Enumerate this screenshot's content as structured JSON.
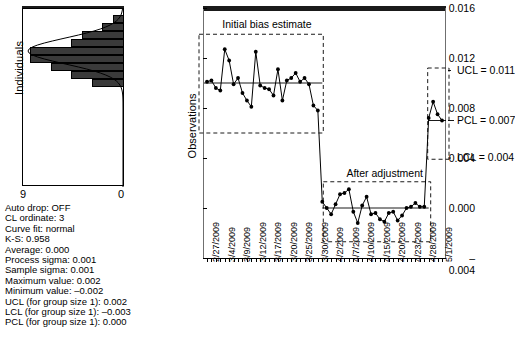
{
  "histogram": {
    "y_axis_label": "Individuals",
    "tick_left": "9",
    "tick_right": "0",
    "bins": [
      {
        "count": 1,
        "y": 96
      },
      {
        "count": 2,
        "y": 104
      },
      {
        "count": 4,
        "y": 112
      },
      {
        "count": 5,
        "y": 120
      },
      {
        "count": 9,
        "y": 128
      },
      {
        "count": 9,
        "y": 136
      },
      {
        "count": 7,
        "y": 144
      },
      {
        "count": 5,
        "y": 152
      },
      {
        "count": 3,
        "y": 160
      }
    ],
    "max_count": 9,
    "curve_fit": "normal"
  },
  "stats": {
    "auto_drop": "Auto drop: OFF",
    "cl_ordinate": "CL ordinate: 3",
    "curve_fit": "Curve fit: normal",
    "ks": "K-S: 0.958",
    "average": "Average: 0.000",
    "process_sigma": "Process sigma: 0.001",
    "sample_sigma": "Sample sigma: 0.001",
    "maximum_value": "Maximum value: 0.002",
    "minimum_value": "Minimum value: –0.002",
    "ucl": "UCL (for group size 1): 0.002",
    "lcl": "LCL (for group size 1): –0.003",
    "pcl": "PCL (for group size 1): 0.000"
  },
  "chart_data": {
    "type": "line",
    "title": "",
    "xlabel": "",
    "ylabel": "Observations",
    "ylim": [
      -0.004,
      0.016
    ],
    "yticks": [
      0.016,
      0.012,
      0.008,
      0.004,
      0.0,
      -0.004
    ],
    "ytick_labels": [
      "0.016",
      "0.012",
      "0.008",
      "0.004",
      "0.000",
      "–0.004"
    ],
    "grid": false,
    "legend": "none",
    "xtick_labels": [
      "2/27/2009",
      "3/4/2009",
      "3/9/2009",
      "3/12/2009",
      "3/17/2009",
      "3/20/2009",
      "3/25/2009",
      "3/30/2009",
      "4/2/2009",
      "4/7/2009",
      "4/10/2009",
      "4/15/2009",
      "4/20/2009",
      "4/23/2009",
      "4/28/2009",
      "5/1/2009"
    ],
    "x_index": [
      1,
      2,
      3,
      4,
      5,
      6,
      7,
      8,
      9,
      10,
      11,
      12,
      13,
      14,
      15,
      16,
      17,
      18,
      19,
      20,
      21,
      22,
      23,
      24,
      25,
      26,
      27,
      28,
      29,
      30,
      31,
      32,
      33,
      34,
      35,
      36,
      37,
      38,
      39,
      40,
      41,
      42,
      43,
      44,
      45,
      46,
      47,
      48,
      49,
      50,
      51,
      52,
      53,
      54,
      55,
      56,
      57,
      58,
      59,
      60,
      61,
      62
    ],
    "values": [
      0.0101,
      0.0102,
      0.0096,
      0.0094,
      0.0127,
      0.0118,
      0.0099,
      0.0104,
      0.0092,
      0.0086,
      0.0081,
      0.0125,
      0.0098,
      0.0096,
      0.0095,
      0.009,
      0.0111,
      0.0086,
      0.0102,
      0.0104,
      0.0108,
      0.0101,
      0.0104,
      0.0099,
      0.0082,
      0.0078,
      0.0005,
      0.0,
      -0.0005,
      0.0003,
      0.0011,
      0.0012,
      0.0015,
      -0.0003,
      -0.0012,
      0.0002,
      0.0009,
      -0.0005,
      -0.0004,
      -0.0009,
      -0.0011,
      -0.0004,
      -0.0003,
      -0.001,
      -0.0006,
      0.0,
      0.0001,
      0.0004,
      0.0001,
      0.0001,
      0.0072,
      0.0085,
      0.0075,
      0.007
    ],
    "center_line_phase1": 0.01,
    "center_line_phase2": 0.0,
    "annotations": [
      {
        "text": "Initial bias estimate",
        "phase": 1
      },
      {
        "text": "After adjustment",
        "phase": 2
      }
    ],
    "control_limits": [
      {
        "label": "UCL = 0.011",
        "value": 0.011
      },
      {
        "label": "PCL = 0.007",
        "value": 0.007
      },
      {
        "label": "LCL = 0.004",
        "value": 0.004
      }
    ],
    "phase1_box": {
      "upper": 0.0139,
      "lower": 0.006,
      "label": "Initial bias estimate"
    },
    "phase2_box": {
      "upper": 0.0021,
      "lower": -0.0027,
      "label": "After adjustment"
    },
    "phase3_box": {
      "upper": 0.0112,
      "lower": 0.0039
    }
  }
}
